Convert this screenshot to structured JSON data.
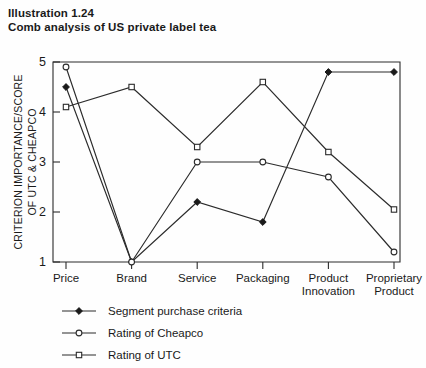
{
  "title": {
    "line1": "Illustration 1.24",
    "line2": "Comb analysis of US private label tea"
  },
  "chart_data": {
    "type": "line",
    "title": "Comb analysis of US private label tea",
    "xlabel": "",
    "ylabel": "CRITERION IMPORTANCE/SCORE OF UTC & CHEAPCO",
    "ylabel_line1": "CRITERION IMPORTANCE/SCORE",
    "ylabel_line2": "OF UTC & CHEAPCO",
    "categories": [
      "Price",
      "Brand",
      "Service",
      "Packaging",
      "Product Innovation",
      "Proprietary Product"
    ],
    "category_lines": [
      [
        "Price"
      ],
      [
        "Brand"
      ],
      [
        "Service"
      ],
      [
        "Packaging"
      ],
      [
        "Product",
        "Innovation"
      ],
      [
        "Proprietary",
        "Product"
      ]
    ],
    "ylim": [
      1,
      5
    ],
    "yticks": [
      1,
      2,
      3,
      4,
      5
    ],
    "grid": false,
    "legend_position": "below-left",
    "series": [
      {
        "name": "Segment purchase criteria",
        "marker": "filled-diamond",
        "values": [
          4.5,
          1.0,
          2.2,
          1.8,
          4.8,
          4.8
        ]
      },
      {
        "name": "Rating of Cheapco",
        "marker": "open-circle",
        "values": [
          4.9,
          1.0,
          3.0,
          3.0,
          2.7,
          1.2
        ]
      },
      {
        "name": "Rating of UTC",
        "marker": "open-square",
        "values": [
          4.1,
          4.5,
          3.3,
          4.6,
          3.2,
          2.05
        ]
      }
    ],
    "colors": {
      "line": "#2b2b2b",
      "axis": "#2b2b2b",
      "text": "#1a1a1a",
      "background": "#fefefe"
    }
  },
  "legend": {
    "items": [
      {
        "label": "Segment purchase criteria",
        "marker": "filled-diamond"
      },
      {
        "label": "Rating of Cheapco",
        "marker": "open-circle"
      },
      {
        "label": "Rating of UTC",
        "marker": "open-square"
      }
    ]
  }
}
